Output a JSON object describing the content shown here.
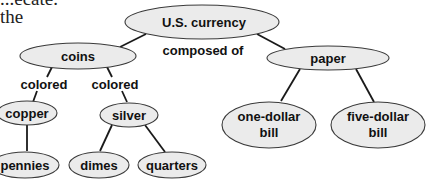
{
  "text_fragments": {
    "line1": "...ecate.",
    "line2": "the"
  },
  "diagram": {
    "type": "concept_map",
    "nodes": {
      "root": "U.S. currency",
      "coins": "coins",
      "paper": "paper",
      "copper": "copper",
      "silver": "silver",
      "pennies": "pennies",
      "dimes": "dimes",
      "quarters": "quarters",
      "one_dollar_line1": "one-dollar",
      "one_dollar_line2": "bill",
      "five_dollar_line1": "five-dollar",
      "five_dollar_line2": "bill"
    },
    "link_labels": {
      "composed_of": "composed of",
      "colored_left": "colored",
      "colored_right": "colored"
    },
    "edges": [
      [
        "U.S. currency",
        "coins"
      ],
      [
        "U.S. currency",
        "paper"
      ],
      [
        "coins",
        "copper"
      ],
      [
        "coins",
        "silver"
      ],
      [
        "copper",
        "pennies"
      ],
      [
        "silver",
        "dimes"
      ],
      [
        "silver",
        "quarters"
      ],
      [
        "paper",
        "one-dollar bill"
      ],
      [
        "paper",
        "five-dollar bill"
      ]
    ],
    "colors": {
      "node_fill": "#ebebeb",
      "node_stroke": "#3a3a3a",
      "edge": "#1a1a1a"
    }
  }
}
